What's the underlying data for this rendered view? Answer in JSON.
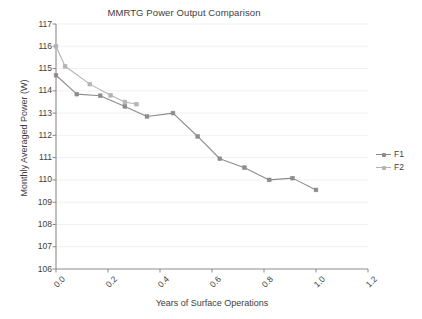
{
  "chart_data": {
    "type": "line",
    "title": "MMRTG Power Output Comparison",
    "xlabel": "Years of Surface Operations",
    "ylabel": "Monthly Averaged Power (W)",
    "xlim": [
      0.0,
      1.2
    ],
    "ylim": [
      106,
      117
    ],
    "xticks": [
      "0.0",
      "0.2",
      "0.4",
      "0.6",
      "0.8",
      "1.0",
      "1.2"
    ],
    "xtick_values": [
      0.0,
      0.2,
      0.4,
      0.6,
      0.8,
      1.0,
      1.2
    ],
    "yticks": [
      "106",
      "107",
      "108",
      "109",
      "110",
      "111",
      "112",
      "113",
      "114",
      "115",
      "116",
      "117"
    ],
    "ytick_values": [
      106,
      107,
      108,
      109,
      110,
      111,
      112,
      113,
      114,
      115,
      116,
      117
    ],
    "grid": true,
    "grid_axis": "y",
    "legend_position": "right",
    "marker": "square",
    "series": [
      {
        "name": "F1",
        "color": "#8c8c8c",
        "points": [
          [
            0.0,
            114.7
          ],
          [
            0.08,
            113.85
          ],
          [
            0.17,
            113.78
          ],
          [
            0.265,
            113.3
          ],
          [
            0.35,
            112.85
          ],
          [
            0.45,
            113.0
          ],
          [
            0.545,
            111.95
          ],
          [
            0.63,
            110.95
          ],
          [
            0.725,
            110.55
          ],
          [
            0.82,
            110.0
          ],
          [
            0.91,
            110.08
          ],
          [
            1.0,
            109.55
          ]
        ]
      },
      {
        "name": "F2",
        "color": "#b4b4b4",
        "points": [
          [
            0.0,
            116.0
          ],
          [
            0.035,
            115.1
          ],
          [
            0.13,
            114.3
          ],
          [
            0.21,
            113.8
          ],
          [
            0.265,
            113.5
          ],
          [
            0.31,
            113.4
          ]
        ]
      }
    ]
  },
  "legend": {
    "entries": [
      {
        "label": "F1"
      },
      {
        "label": "F2"
      }
    ]
  },
  "colors": {
    "axis": "#8a8a8a",
    "grid": "#f1f1f4",
    "text": "#3d3d3d",
    "series_f1": "#8c8c8c",
    "series_f2": "#b4b4b4",
    "background": "#ffffff"
  }
}
